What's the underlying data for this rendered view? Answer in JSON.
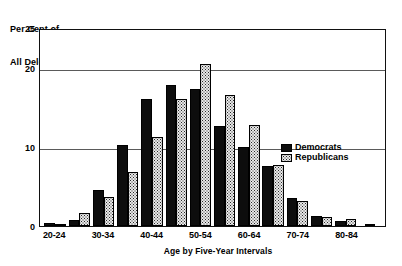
{
  "chart_data": {
    "type": "bar",
    "title": "",
    "ylabel": "Per Cent of All Delegates",
    "ylabel_line1": "Per Cent of",
    "ylabel_line2": "All Delegates",
    "xlabel": "Age by Five-Year Intervals",
    "ylim": [
      0,
      25
    ],
    "yticks": [
      0,
      10,
      20,
      25
    ],
    "ytick_labels": [
      "0",
      "10",
      "20",
      "25"
    ],
    "gridlines": [
      10,
      20
    ],
    "grid": true,
    "legend_position": "upper right inside",
    "categories": [
      "20-24",
      "25-29",
      "30-34",
      "35-39",
      "40-44",
      "45-49",
      "50-54",
      "55-59",
      "60-64",
      "65-69",
      "70-74",
      "75-79",
      "80-84",
      "85-89"
    ],
    "xtick_labels_shown": [
      "20-24",
      "",
      "30-34",
      "",
      "40-44",
      "",
      "50-54",
      "",
      "60-64",
      "",
      "70-74",
      "",
      "80-84",
      ""
    ],
    "series": [
      {
        "name": "Democrats",
        "color": "#0d0d0d",
        "pattern": "solid-black",
        "values": [
          0.4,
          0.7,
          4.6,
          10.2,
          16.1,
          17.8,
          17.3,
          12.6,
          10.0,
          7.6,
          3.5,
          1.3,
          0.6,
          0.3
        ]
      },
      {
        "name": "Republicans",
        "color": "#e8e8e8",
        "pattern": "stipple-dots",
        "values": [
          0.2,
          1.6,
          3.7,
          6.8,
          11.2,
          16.0,
          20.5,
          16.6,
          12.8,
          7.7,
          3.2,
          1.1,
          0.9,
          0.0
        ]
      }
    ],
    "legend": [
      {
        "label": "Democrats",
        "swatch": "solid-black"
      },
      {
        "label": "Republicans",
        "swatch": "stipple-dots"
      }
    ]
  }
}
